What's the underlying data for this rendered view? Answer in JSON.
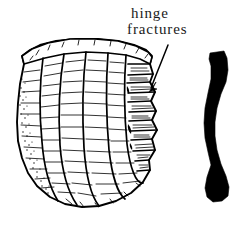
{
  "figure": {
    "kind": "line-drawing",
    "background_color": "#ffffff",
    "ink_color": "#000000",
    "text_color": "#1a1a1a"
  },
  "annotation": {
    "label_line_1": "hinge",
    "label_line_2": "fractures",
    "leader": {
      "icon": "curved-arrow-icon",
      "from_x": 168,
      "from_y": 45,
      "tip_x": 149,
      "tip_y": 92
    }
  },
  "artifact": {
    "name": "flaked-stone-core",
    "view": "face-view",
    "outline_color": "#000000",
    "fill_color": "#ffffff",
    "features": [
      "flat-striking-platform-top",
      "long-vertical-flake-scars",
      "horizontal-ripple-hatching",
      "stepped-hinge-fracture-terminations-right-edge",
      "stippled-cortex-left-edge",
      "rounded-base"
    ]
  },
  "profile": {
    "name": "core-side-profile",
    "fill_color": "#000000",
    "shape": "sinuous-elongated-silhouette"
  }
}
